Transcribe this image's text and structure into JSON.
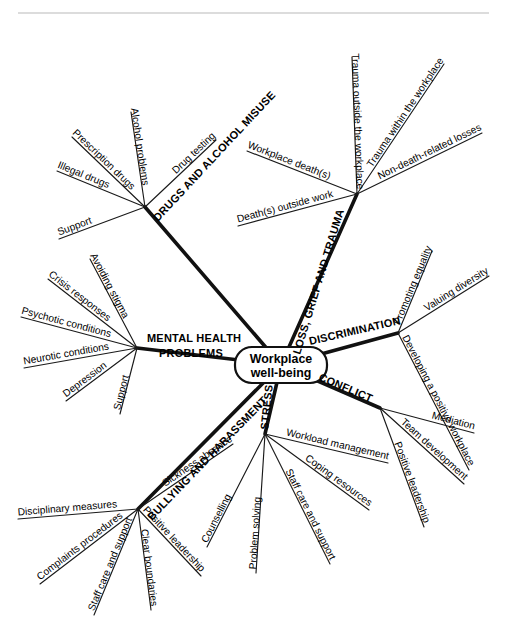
{
  "diagram": {
    "center": {
      "line1": "Workplace",
      "line2": "well-being",
      "x": 281,
      "y": 365
    },
    "style": {
      "ink": "#111111",
      "background": "#ffffff",
      "rule_color": "#b9b9b9"
    },
    "top_rule": {
      "y": 13,
      "x1": 18,
      "x2": 489
    },
    "branches": [
      {
        "id": "drugs",
        "label": "DRUGS AND ALCOHOL MISUSE",
        "hub": {
          "x": 145,
          "y": 207
        },
        "label_angle": -47,
        "label_anchor": {
          "x": 158,
          "y": 222
        },
        "children": [
          {
            "label": "Illegal drugs",
            "end": {
              "x": 57,
              "y": 171
            },
            "angle": -22
          },
          {
            "label": "Prescription drugs",
            "end": {
              "x": 72,
              "y": 137
            },
            "angle": -36
          },
          {
            "label": "Alcohol problems",
            "end": {
              "x": 131,
              "y": 112
            },
            "angle": -76
          },
          {
            "label": "Drug testing",
            "end": {
              "x": 216,
              "y": 140
            },
            "angle": -37
          },
          {
            "label": "Support",
            "end": {
              "x": 59,
              "y": 239
            },
            "angle": -22
          }
        ]
      },
      {
        "id": "loss",
        "label": "LOSS, GRIEF AND TRAUMA",
        "hub": {
          "x": 357,
          "y": 194
        },
        "label_angle": -73,
        "label_anchor": {
          "x": 300,
          "y": 355
        },
        "children": [
          {
            "label": "Workplace death(s)",
            "end": {
              "x": 247,
              "y": 151
            },
            "angle": -17
          },
          {
            "label": "Trauma outside the workplace",
            "end": {
              "x": 352,
              "y": 57
            },
            "angle": -89
          },
          {
            "label": "Trauma within the workplace",
            "end": {
              "x": 444,
              "y": 64
            },
            "angle": -47
          },
          {
            "label": "Non-death-related losses",
            "end": {
              "x": 482,
              "y": 133
            },
            "angle": -28
          },
          {
            "label": "Death(s) outside work",
            "end": {
              "x": 238,
              "y": 226
            },
            "angle": -18
          }
        ]
      },
      {
        "id": "discrimination",
        "label": "DISCRIMINATION",
        "hub": {
          "x": 398,
          "y": 333
        },
        "label_angle": -13,
        "label_anchor": {
          "x": 310,
          "y": 345
        },
        "children": [
          {
            "label": "Promoting equality",
            "end": {
              "x": 432,
              "y": 251
            },
            "angle": -65
          },
          {
            "label": "Valuing diversity",
            "end": {
              "x": 489,
              "y": 276
            },
            "angle": -40
          },
          {
            "label": "Developing a positive workplace",
            "end": {
              "x": 469,
              "y": 470
            },
            "angle": 61
          }
        ]
      },
      {
        "id": "conflict",
        "label": "CONFLICT",
        "hub": {
          "x": 380,
          "y": 408
        },
        "label_angle": 23,
        "label_anchor": {
          "x": 318,
          "y": 380
        },
        "children": [
          {
            "label": "Mediation",
            "end": {
              "x": 474,
              "y": 433
            },
            "angle": 17
          },
          {
            "label": "Team development",
            "end": {
              "x": 464,
              "y": 484
            },
            "angle": 42
          },
          {
            "label": "Positive leadership",
            "end": {
              "x": 424,
              "y": 527
            },
            "angle": 64
          }
        ]
      },
      {
        "id": "stress",
        "label": "STRESS",
        "hub": {
          "x": 265,
          "y": 434
        },
        "label_angle": -84,
        "label_anchor": {
          "x": 268,
          "y": 430
        },
        "children": [
          {
            "label": "Workload management",
            "end": {
              "x": 388,
              "y": 463
            },
            "angle": 17
          },
          {
            "label": "Coping resources",
            "end": {
              "x": 369,
              "y": 510
            },
            "angle": 38
          },
          {
            "label": "Staff care and support",
            "end": {
              "x": 330,
              "y": 564
            },
            "angle": 60
          },
          {
            "label": "Problem solving",
            "end": {
              "x": 256,
              "y": 573
            },
            "angle": 84
          },
          {
            "label": "Counselling",
            "end": {
              "x": 207,
              "y": 547
            },
            "angle": 65
          }
        ]
      },
      {
        "id": "bullying",
        "label": "BULLYING AND HARASSMENT",
        "hub": {
          "x": 138,
          "y": 509
        },
        "label_angle": -46,
        "label_anchor": {
          "x": 152,
          "y": 521
        },
        "children": [
          {
            "label": "Sickness absence",
            "end": {
              "x": 233,
              "y": 444
            },
            "angle": -33
          },
          {
            "label": "Disciplinary measures",
            "end": {
              "x": 18,
              "y": 519
            },
            "angle": -4
          },
          {
            "label": "Complaints procedures",
            "end": {
              "x": 40,
              "y": 584
            },
            "angle": 35
          },
          {
            "label": "Staff care and support",
            "end": {
              "x": 94,
              "y": 615
            },
            "angle": 63
          },
          {
            "label": "Clear boundaries",
            "end": {
              "x": 151,
              "y": 610
            },
            "angle": 83
          },
          {
            "label": "Positive leadership",
            "end": {
              "x": 201,
              "y": 576
            },
            "angle": 55
          }
        ]
      },
      {
        "id": "mental",
        "label": "MENTAL HEALTH PROBLEMS",
        "label_line1": "MENTAL HEALTH",
        "label_line2": "PROBLEMS",
        "hub": {
          "x": 137,
          "y": 348
        },
        "label_angle": 0,
        "label_anchor": {
          "x": 147,
          "y": 342
        },
        "children": [
          {
            "label": "Avoiding stigma",
            "end": {
              "x": 90,
              "y": 259
            },
            "angle": -65
          },
          {
            "label": "Crisis responses",
            "end": {
              "x": 48,
              "y": 279
            },
            "angle": -38
          },
          {
            "label": "Psychotic conditions",
            "end": {
              "x": 21,
              "y": 317
            },
            "angle": -16
          },
          {
            "label": "Neurotic conditions",
            "end": {
              "x": 24,
              "y": 368
            },
            "angle": 11
          },
          {
            "label": "Depression",
            "end": {
              "x": 66,
              "y": 401
            },
            "angle": 38
          },
          {
            "label": "Support",
            "end": {
              "x": 120,
              "y": 414
            },
            "angle": 73
          }
        ]
      }
    ]
  }
}
